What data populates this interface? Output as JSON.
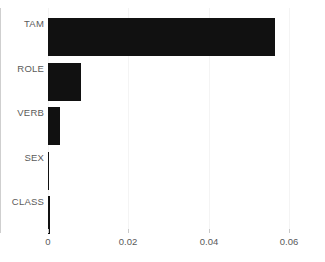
{
  "chart_data": {
    "type": "bar",
    "orientation": "horizontal",
    "title": "",
    "subtitle": "",
    "xlabel": "",
    "ylabel": "",
    "categories": [
      "TAM",
      "ROLE",
      "VERB",
      "SEX",
      "CLASS"
    ],
    "values": [
      0.0565,
      0.0082,
      0.003,
      0.0003,
      0.0006
    ],
    "xlim": [
      0,
      0.062
    ],
    "xticks": [
      0,
      0.02,
      0.04,
      0.06
    ],
    "xtick_labels": [
      "0",
      "0.02",
      "0.04",
      "0.06"
    ],
    "grid": true,
    "grid_axis": "x",
    "legend": false,
    "legend_position": "none",
    "bar_color": "#111111",
    "grid_color": "#f4f4f4",
    "axis_color": "#cfcfcf",
    "tick_label_color": "#5a5a5a",
    "background_color": "#ffffff"
  }
}
